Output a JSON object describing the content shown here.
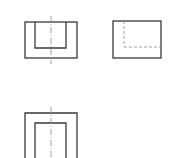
{
  "diagram": {
    "type": "orthographic-projection",
    "colors": {
      "visible_line": "#3a3a3a",
      "auxiliary_line": "#8a8a8a",
      "background": "#ffffff"
    },
    "views": [
      {
        "name": "front-view",
        "outer_rect": {
          "x": 25,
          "y": 22,
          "w": 52,
          "h": 36
        },
        "inner_rect_open_top": {
          "x": 35,
          "y": 22,
          "w": 31,
          "h": 26
        },
        "center_line": {
          "x": 51,
          "y1": 16,
          "y2": 64
        }
      },
      {
        "name": "side-view",
        "outer_rect": {
          "x": 113,
          "y": 21,
          "w": 48,
          "h": 37
        },
        "hidden_lines": [
          {
            "x1": 124,
            "y1": 21,
            "x2": 124,
            "y2": 47
          },
          {
            "x1": 124,
            "y1": 47,
            "x2": 161,
            "y2": 47
          }
        ]
      },
      {
        "name": "top-view",
        "outer_rect": {
          "x": 25,
          "y": 113,
          "w": 52,
          "h": 50
        },
        "inner_rect": {
          "x": 35,
          "y": 123,
          "w": 31,
          "h": 40
        },
        "center_line": {
          "x": 51,
          "y1": 107,
          "y2": 158
        }
      }
    ]
  }
}
